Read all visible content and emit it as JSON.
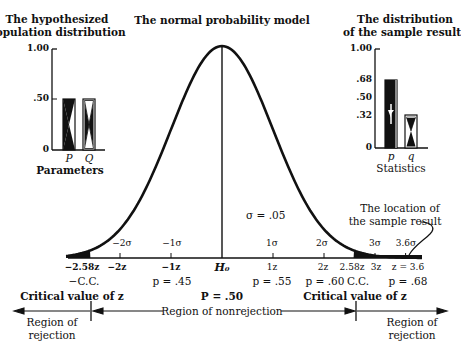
{
  "titles": {
    "left": [
      "The hypothesized",
      "population distribution"
    ],
    "center": "The normal probability model",
    "right": [
      "The distribution",
      "of the sample result"
    ]
  },
  "left_chart": {
    "yticks": [
      "1.00",
      ".50",
      "0"
    ],
    "bars": [
      {
        "label": "P",
        "value": 0.5
      },
      {
        "label": "Q",
        "value": 0.5
      }
    ],
    "xlabel": "Parameters"
  },
  "right_chart": {
    "yticks": [
      "1.00",
      ".68",
      ".50",
      ".32",
      "0"
    ],
    "bars": [
      {
        "label": "p",
        "value": 0.68
      },
      {
        "label": "q",
        "value": 0.32
      }
    ],
    "xlabel": "Statistics"
  },
  "normal": {
    "sigma_note": "σ = .05",
    "sigma_labels": [
      "−2σ",
      "−1σ",
      "1σ",
      "2σ",
      "3σ",
      "3.6σ"
    ],
    "z_labels": [
      "−2.58z",
      "−2z",
      "−1z",
      "H₀",
      "1z",
      "2z",
      "2.58z",
      "3z",
      "z = 3.6"
    ],
    "p_labels": [
      "−C.C.",
      "p = .45",
      "p = .55",
      "p = .60",
      "C.C.",
      "p = .68"
    ],
    "center_p": "P = .50",
    "critical_left": "Critical value of z",
    "critical_right": "Critical value of z",
    "annotation": [
      "The location of",
      "the sample result"
    ]
  },
  "regions": {
    "left": [
      "Region of",
      "rejection"
    ],
    "middle": "Region of nonrejection",
    "right": [
      "Region of",
      "rejection"
    ]
  },
  "chart_data": {
    "type": "diagram",
    "title": "The normal probability model",
    "population": {
      "P": 0.5,
      "Q": 0.5
    },
    "sample": {
      "p": 0.68,
      "q": 0.32
    },
    "sigma": 0.05,
    "H0": 0.5,
    "critical_z": 2.58,
    "observed_z": 3.6,
    "p_at_z": {
      "-1": 0.45,
      "1": 0.55,
      "2": 0.6,
      "3.6": 0.68
    }
  }
}
